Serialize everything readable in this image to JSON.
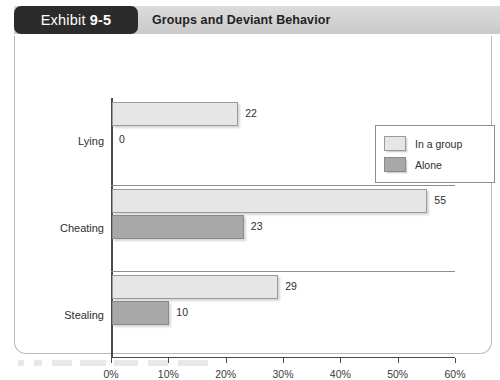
{
  "header": {
    "exhibit_word": "Exhibit",
    "exhibit_number": "9-5",
    "title": "Groups and Deviant Behavior"
  },
  "chart_data": {
    "type": "bar",
    "orientation": "horizontal",
    "title": "Groups and Deviant Behavior",
    "xlabel": "",
    "ylabel": "",
    "categories": [
      "Lying",
      "Cheating",
      "Stealing"
    ],
    "series": [
      {
        "name": "In a group",
        "values": [
          22,
          55,
          29
        ],
        "color": "#e6e6e6"
      },
      {
        "name": "Alone",
        "values": [
          0,
          23,
          10
        ],
        "color": "#a8a8a8"
      }
    ],
    "value_labels": {
      "Lying": {
        "In a group": "22",
        "Alone": "0"
      },
      "Cheating": {
        "In a group": "55",
        "Alone": "23"
      },
      "Stealing": {
        "In a group": "29",
        "Alone": "10"
      }
    },
    "xlim": [
      0,
      60
    ],
    "xticks": [
      0,
      10,
      20,
      30,
      40,
      50,
      60
    ],
    "xtick_labels": [
      "0%",
      "10%",
      "20%",
      "30%",
      "40%",
      "50%",
      "60%"
    ],
    "grid": false,
    "legend_position": "top-right",
    "legend_entries": [
      "In a group",
      "Alone"
    ]
  }
}
